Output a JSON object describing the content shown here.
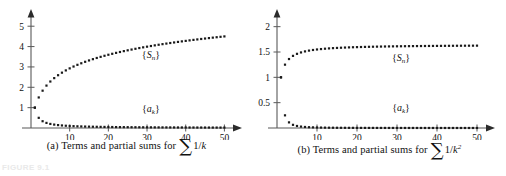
{
  "figure": {
    "tag": "FIGURE 9.1",
    "panel_count": 2
  },
  "colors": {
    "axis": "#595959",
    "point": "#1a1a1a",
    "text": "#111111",
    "background": "#ffffff"
  },
  "chart_data": [
    {
      "id": "panel-a",
      "type": "scatter",
      "title": "(a) Terms and partial sums for ∑ 1/k",
      "caption_prefix": "(a) Terms and partial sums for",
      "caption_sigma": "∑",
      "caption_expr": "1/k",
      "xlabel": "",
      "ylabel": "",
      "xlim": [
        0,
        53
      ],
      "ylim": [
        0,
        5.6
      ],
      "grid": false,
      "legend_position": "inline-annotation",
      "xticks": [
        10,
        20,
        30,
        40,
        50
      ],
      "xticklabels": [
        "10",
        "20",
        "30",
        "40",
        "50"
      ],
      "yticks": [
        1,
        2,
        3,
        4,
        5
      ],
      "yticklabels": [
        "1",
        "2",
        "3",
        "4",
        "5"
      ],
      "series": [
        {
          "name": "{S_n}",
          "label_sym": "S",
          "label_sub": "n",
          "label_x": 31,
          "label_y": 3.45,
          "x": [
            1,
            2,
            3,
            4,
            5,
            6,
            7,
            8,
            9,
            10,
            11,
            12,
            13,
            14,
            15,
            16,
            17,
            18,
            19,
            20,
            21,
            22,
            23,
            24,
            25,
            26,
            27,
            28,
            29,
            30,
            31,
            32,
            33,
            34,
            35,
            36,
            37,
            38,
            39,
            40,
            41,
            42,
            43,
            44,
            45,
            46,
            47,
            48,
            49,
            50
          ],
          "values": [
            1.0,
            1.5,
            1.833,
            2.083,
            2.283,
            2.45,
            2.593,
            2.718,
            2.829,
            2.929,
            3.02,
            3.103,
            3.18,
            3.252,
            3.318,
            3.381,
            3.44,
            3.495,
            3.548,
            3.598,
            3.645,
            3.691,
            3.734,
            3.776,
            3.816,
            3.854,
            3.891,
            3.927,
            3.962,
            3.995,
            4.027,
            4.059,
            4.089,
            4.119,
            4.147,
            4.175,
            4.202,
            4.229,
            4.255,
            4.279,
            4.304,
            4.328,
            4.351,
            4.373,
            4.395,
            4.417,
            4.438,
            4.459,
            4.479,
            4.499
          ]
        },
        {
          "name": "{a_k}",
          "label_sym": "a",
          "label_sub": "k",
          "label_x": 31,
          "label_y": 0.8,
          "x": [
            1,
            2,
            3,
            4,
            5,
            6,
            7,
            8,
            9,
            10,
            11,
            12,
            13,
            14,
            15,
            16,
            17,
            18,
            19,
            20,
            21,
            22,
            23,
            24,
            25,
            26,
            27,
            28,
            29,
            30,
            31,
            32,
            33,
            34,
            35,
            36,
            37,
            38,
            39,
            40,
            41,
            42,
            43,
            44,
            45,
            46,
            47,
            48,
            49,
            50
          ],
          "values": [
            1.0,
            0.5,
            0.333,
            0.25,
            0.2,
            0.167,
            0.143,
            0.125,
            0.111,
            0.1,
            0.091,
            0.083,
            0.077,
            0.071,
            0.067,
            0.063,
            0.059,
            0.056,
            0.053,
            0.05,
            0.048,
            0.045,
            0.043,
            0.042,
            0.04,
            0.038,
            0.037,
            0.036,
            0.034,
            0.033,
            0.032,
            0.031,
            0.03,
            0.029,
            0.029,
            0.028,
            0.027,
            0.026,
            0.026,
            0.025,
            0.024,
            0.024,
            0.023,
            0.023,
            0.022,
            0.022,
            0.021,
            0.021,
            0.02,
            0.02
          ]
        }
      ]
    },
    {
      "id": "panel-b",
      "type": "scatter",
      "title": "(b) Terms and partial sums for ∑ 1/k²",
      "caption_prefix": "(b) Terms and partial sums for",
      "caption_sigma": "∑",
      "caption_expr": "1/k",
      "caption_expr_sup": "2",
      "xlabel": "",
      "ylabel": "",
      "xlim": [
        0,
        53
      ],
      "ylim": [
        0,
        2.25
      ],
      "grid": false,
      "legend_position": "inline-annotation",
      "xticks": [
        10,
        20,
        30,
        40,
        50
      ],
      "xticklabels": [
        "10",
        "20",
        "30",
        "40",
        "50"
      ],
      "yticks": [
        0.5,
        1,
        1.5,
        2
      ],
      "yticklabels": [
        "0.5",
        "1",
        "1.5",
        "2"
      ],
      "series": [
        {
          "name": "{S_n}",
          "label_sym": "S",
          "label_sub": "n",
          "label_x": 31,
          "label_y": 1.33,
          "x": [
            1,
            2,
            3,
            4,
            5,
            6,
            7,
            8,
            9,
            10,
            11,
            12,
            13,
            14,
            15,
            16,
            17,
            18,
            19,
            20,
            21,
            22,
            23,
            24,
            25,
            26,
            27,
            28,
            29,
            30,
            31,
            32,
            33,
            34,
            35,
            36,
            37,
            38,
            39,
            40,
            41,
            42,
            43,
            44,
            45,
            46,
            47,
            48,
            49,
            50
          ],
          "values": [
            1.0,
            1.25,
            1.3611,
            1.4236,
            1.4636,
            1.4914,
            1.5118,
            1.5274,
            1.5398,
            1.5498,
            1.558,
            1.565,
            1.5709,
            1.576,
            1.5804,
            1.5843,
            1.5878,
            1.5909,
            1.5937,
            1.5962,
            1.5985,
            1.6006,
            1.6025,
            1.6043,
            1.6059,
            1.6074,
            1.6088,
            1.6101,
            1.6113,
            1.6124,
            1.6134,
            1.6144,
            1.6153,
            1.6162,
            1.617,
            1.6177,
            1.6185,
            1.6192,
            1.6198,
            1.6204,
            1.621,
            1.6216,
            1.6221,
            1.6226,
            1.6231,
            1.6236,
            1.6241,
            1.6245,
            1.6249,
            1.6253
          ]
        },
        {
          "name": "{a_k}",
          "label_sym": "a",
          "label_sub": "k",
          "label_x": 31,
          "label_y": 0.33,
          "x": [
            1,
            2,
            3,
            4,
            5,
            6,
            7,
            8,
            9,
            10,
            11,
            12,
            13,
            14,
            15,
            16,
            17,
            18,
            19,
            20,
            21,
            22,
            23,
            24,
            25,
            26,
            27,
            28,
            29,
            30,
            31,
            32,
            33,
            34,
            35,
            36,
            37,
            38,
            39,
            40,
            41,
            42,
            43,
            44,
            45,
            46,
            47,
            48,
            49,
            50
          ],
          "values": [
            1.0,
            0.25,
            0.1111,
            0.0625,
            0.04,
            0.0278,
            0.0204,
            0.0156,
            0.0123,
            0.01,
            0.0083,
            0.0069,
            0.0059,
            0.0051,
            0.0044,
            0.0039,
            0.0035,
            0.0031,
            0.0028,
            0.0025,
            0.0023,
            0.0021,
            0.0019,
            0.0017,
            0.0016,
            0.0015,
            0.0014,
            0.0013,
            0.0012,
            0.0011,
            0.001,
            0.001,
            0.0009,
            0.0009,
            0.0008,
            0.0008,
            0.0007,
            0.0007,
            0.0007,
            0.0006,
            0.0006,
            0.0006,
            0.0005,
            0.0005,
            0.0005,
            0.0005,
            0.0005,
            0.0004,
            0.0004,
            0.0004
          ]
        }
      ]
    }
  ]
}
